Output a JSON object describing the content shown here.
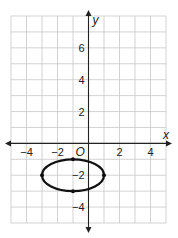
{
  "chart_data": {
    "type": "line",
    "title": "",
    "xlabel": "x",
    "ylabel": "y",
    "origin_label": "O",
    "xlim": [
      -5,
      5
    ],
    "ylim": [
      -5,
      8
    ],
    "grid": true,
    "x_ticks": [
      {
        "value": -4,
        "label": "−4"
      },
      {
        "value": -2,
        "label": "−2"
      },
      {
        "value": 2,
        "label": "2"
      },
      {
        "value": 4,
        "label": "4"
      }
    ],
    "y_ticks": [
      {
        "value": 6,
        "label": "6"
      },
      {
        "value": 4,
        "label": "4"
      },
      {
        "value": 2,
        "label": "2"
      },
      {
        "value": -2,
        "label": "−2"
      },
      {
        "value": -4,
        "label": "−4"
      }
    ],
    "series": [
      {
        "name": "ellipse",
        "shape": "ellipse",
        "center": [
          -1,
          -2
        ],
        "semi_axis_x": 2,
        "semi_axis_y": 1,
        "marked_points": [
          [
            -3,
            -2
          ],
          [
            1,
            -2
          ],
          [
            -1,
            -1
          ],
          [
            -1,
            -3
          ]
        ]
      }
    ]
  }
}
